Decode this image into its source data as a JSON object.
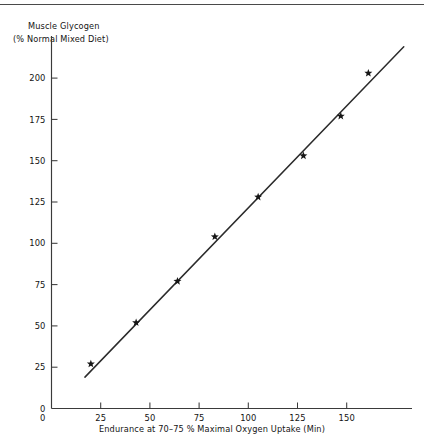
{
  "figure": {
    "y_axis_title_line1": "Muscle Glycogen",
    "y_axis_title_line2": "(% Normal Mixed Diet)",
    "x_axis_title": "Endurance at 70–75 % Maximal Oxygen Uptake (Min)"
  },
  "chart_data": {
    "type": "scatter",
    "title": "",
    "subtitle": "",
    "xlabel": "Endurance at 70–75 % Maximal Oxygen Uptake (Min)",
    "ylabel": "Muscle Glycogen (% Normal Mixed Diet)",
    "xlim": [
      0,
      180
    ],
    "ylim": [
      0,
      222
    ],
    "grid": false,
    "legend": "none",
    "x_ticks": [
      0,
      25,
      50,
      75,
      100,
      125,
      150
    ],
    "x_tick_labels": [
      "0",
      "25",
      "50",
      "75",
      "100",
      "125",
      "150"
    ],
    "y_ticks": [
      0,
      25,
      50,
      75,
      100,
      125,
      150,
      175,
      200
    ],
    "y_tick_labels": [
      "0",
      "25",
      "50",
      "75",
      "100",
      "125",
      "150",
      "175",
      "200"
    ],
    "series": [
      {
        "name": "Subjects",
        "marker": "star",
        "x": [
          20,
          43,
          64,
          83,
          105,
          128,
          147,
          161
        ],
        "y": [
          27,
          52,
          77,
          104,
          128,
          153,
          177,
          203
        ],
        "points": [
          {
            "x": 20,
            "y": 27
          },
          {
            "x": 43,
            "y": 52
          },
          {
            "x": 64,
            "y": 77
          },
          {
            "x": 83,
            "y": 104
          },
          {
            "x": 105,
            "y": 128
          },
          {
            "x": 128,
            "y": 153
          },
          {
            "x": 147,
            "y": 177
          },
          {
            "x": 161,
            "y": 203
          }
        ]
      },
      {
        "name": "Regression line",
        "type": "line",
        "x": [
          17,
          179
        ],
        "y": [
          19,
          219
        ]
      }
    ]
  },
  "colors": {
    "ink": "#161616",
    "axis": "#3a3a3a",
    "line": "#2b2b2b",
    "background": "#ffffff"
  }
}
